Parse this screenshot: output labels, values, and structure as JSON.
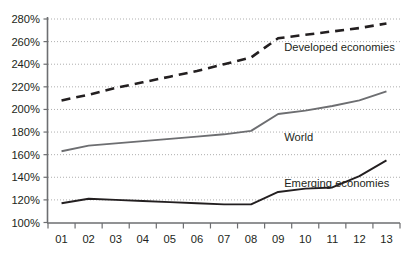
{
  "chart_data": {
    "type": "line",
    "title": "",
    "subtitle": "",
    "xlabel": "",
    "ylabel": "",
    "x": [
      "01",
      "02",
      "03",
      "04",
      "05",
      "06",
      "07",
      "08",
      "09",
      "10",
      "11",
      "12",
      "13"
    ],
    "xtick_labels": [
      "01",
      "02",
      "03",
      "04",
      "05",
      "06",
      "07",
      "08",
      "09",
      "10",
      "11",
      "12",
      "13"
    ],
    "ytick_labels": [
      "100%",
      "120%",
      "140%",
      "160%",
      "180%",
      "200%",
      "220%",
      "240%",
      "260%",
      "280%"
    ],
    "ytick_values": [
      100,
      120,
      140,
      160,
      180,
      200,
      220,
      240,
      260,
      280
    ],
    "ylim": [
      100,
      280
    ],
    "grid": true,
    "legend_position": "inline-annotations",
    "series": [
      {
        "name": "Developed economies",
        "style": "dashed",
        "color": "#231f20",
        "values": [
          208,
          213,
          219,
          224,
          229,
          234,
          240,
          246,
          263,
          266,
          269,
          272,
          276
        ],
        "label_x": "09",
        "label_y": 252
      },
      {
        "name": "World",
        "style": "solid",
        "color": "#6d6e71",
        "values": [
          163,
          168,
          170,
          172,
          174,
          176,
          178,
          181,
          196,
          199,
          203,
          208,
          216
        ],
        "label_x": "09",
        "label_y": 172
      },
      {
        "name": "Emerging economies",
        "style": "solid",
        "color": "#231f20",
        "values": [
          117,
          121,
          120,
          119,
          118,
          117,
          116,
          116,
          127,
          130,
          131,
          141,
          155
        ],
        "label_x": "09",
        "label_y": 131
      }
    ],
    "colors": {
      "axis": "#6d6e71",
      "gridline": "#9a9a9a",
      "text": "#231f20",
      "developed": "#231f20",
      "world": "#6d6e71",
      "emerging": "#231f20",
      "background": "#ffffff"
    }
  }
}
